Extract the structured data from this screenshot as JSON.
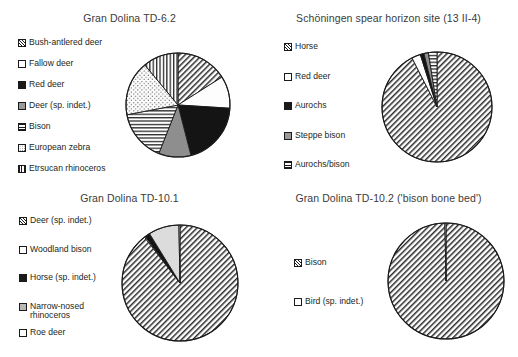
{
  "figure": {
    "background": "#ffffff",
    "outline_color": "#1a1a1a",
    "title_color": "#3b3b3b",
    "label_color": "#231f20"
  },
  "footer": {
    "partial_text": ""
  },
  "charts": [
    {
      "id": "gran-dolina-td-6-2",
      "title": "Gran Dolina TD-6.2",
      "type": "pie",
      "center": {
        "x": 178,
        "y": 105
      },
      "radius": 52,
      "legend": {
        "x": 18,
        "y": 38
      },
      "categories": [
        "Bush-antlered deer",
        "Fallow deer",
        "Red deer",
        "Deer (sp. indet.)",
        "Bison",
        "European zebra",
        "Etrsucan rhinoceros"
      ],
      "values": [
        16,
        10,
        20,
        10,
        16,
        17,
        11
      ],
      "patterns": [
        "diagonal",
        "white",
        "black",
        "gray",
        "horizontal",
        "dotted",
        "vertical"
      ],
      "swatch_classes": [
        "sw-diag",
        "sw-white",
        "sw-black",
        "sw-gray",
        "sw-horiz",
        "sw-dots",
        "sw-vert"
      ]
    },
    {
      "id": "schoningen-spear-horizon",
      "title": "Schöningen spear horizon site (13 II-4)",
      "type": "pie",
      "center": {
        "x": 437,
        "y": 107
      },
      "radius": 55,
      "legend": {
        "x": 284,
        "y": 42
      },
      "categories": [
        "Horse",
        "Red deer",
        "Aurochs",
        "Steppe bison",
        "Aurochs/bison"
      ],
      "values": [
        92.5,
        2.6,
        1.1,
        1.3,
        2.5
      ],
      "patterns": [
        "diagonal",
        "white",
        "black",
        "gray",
        "horizontal"
      ],
      "swatch_classes": [
        "sw-diag",
        "sw-white",
        "sw-black",
        "sw-gray",
        "sw-horiz"
      ]
    },
    {
      "id": "gran-dolina-td-10-1",
      "title": "Gran Dolina TD-10.1",
      "type": "pie",
      "center": {
        "x": 180,
        "y": 283
      },
      "radius": 58,
      "legend": {
        "x": 19,
        "y": 216
      },
      "categories": [
        "Deer (sp. indet.)",
        "Woodland bison",
        "Horse (sp. indet.)",
        "Narrow-nosed rhinoceros",
        "Roe deer"
      ],
      "values": [
        89.5,
        0.3,
        1.4,
        8.5,
        0.3
      ],
      "patterns": [
        "diagonal",
        "white",
        "black",
        "ltgray",
        "white"
      ],
      "swatch_classes": [
        "sw-diag",
        "sw-white",
        "sw-black",
        "sw-hgray",
        "sw-white"
      ],
      "legend_wrap": [
        false,
        false,
        false,
        true,
        false
      ]
    },
    {
      "id": "gran-dolina-td-10-2",
      "title": "Gran Dolina TD-10.2 ('bison bone bed')",
      "type": "pie",
      "center": {
        "x": 446,
        "y": 281
      },
      "radius": 58,
      "legend": {
        "x": 294,
        "y": 258
      },
      "categories": [
        "Bison",
        "Bird (sp. indet.)"
      ],
      "values": [
        99.7,
        0.3
      ],
      "patterns": [
        "diagonal",
        "white"
      ],
      "swatch_classes": [
        "sw-diag",
        "sw-white"
      ]
    }
  ],
  "chart_data": [
    {
      "type": "pie",
      "title": "Gran Dolina TD-6.2",
      "categories": [
        "Bush-antlered deer",
        "Fallow deer",
        "Red deer",
        "Deer (sp. indet.)",
        "Bison",
        "European zebra",
        "Etrsucan rhinoceros"
      ],
      "values": [
        16,
        10,
        20,
        10,
        16,
        17,
        11
      ],
      "unit": "percent",
      "legend_position": "left",
      "xlabel": "",
      "ylabel": ""
    },
    {
      "type": "pie",
      "title": "Schöningen spear horizon site (13 II-4)",
      "categories": [
        "Horse",
        "Red deer",
        "Aurochs",
        "Steppe bison",
        "Aurochs/bison"
      ],
      "values": [
        92.5,
        2.6,
        1.1,
        1.3,
        2.5
      ],
      "unit": "percent",
      "legend_position": "left",
      "xlabel": "",
      "ylabel": ""
    },
    {
      "type": "pie",
      "title": "Gran Dolina TD-10.1",
      "categories": [
        "Deer (sp. indet.)",
        "Woodland bison",
        "Horse (sp. indet.)",
        "Narrow-nosed rhinoceros",
        "Roe deer"
      ],
      "values": [
        89.5,
        0.3,
        1.4,
        8.5,
        0.3
      ],
      "unit": "percent",
      "legend_position": "left",
      "xlabel": "",
      "ylabel": ""
    },
    {
      "type": "pie",
      "title": "Gran Dolina TD-10.2 ('bison bone bed')",
      "categories": [
        "Bison",
        "Bird (sp. indet.)"
      ],
      "values": [
        99.7,
        0.3
      ],
      "unit": "percent",
      "legend_position": "left",
      "xlabel": "",
      "ylabel": ""
    }
  ]
}
